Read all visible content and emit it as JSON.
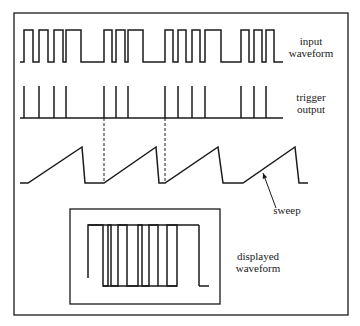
{
  "labels": {
    "input_waveform": [
      "input",
      "waveform"
    ],
    "trigger_output": [
      "trigger",
      "output"
    ],
    "sweep": "sweep",
    "displayed_waveform": [
      "displayed",
      "waveform"
    ]
  },
  "colors": {
    "ink": "#1a1a1a",
    "background": "#ffffff"
  },
  "geometry": {
    "outer_frame": {
      "x": 14,
      "y": 13,
      "w": 334,
      "h": 302
    },
    "display_box": {
      "x": 70,
      "y": 209,
      "w": 150,
      "h": 95
    },
    "input": {
      "low_y": 62,
      "high_y": 30,
      "start_x": 20,
      "end_x": 283,
      "pulses": [
        [
          24,
          33
        ],
        [
          39,
          48
        ],
        [
          54,
          63
        ],
        [
          66,
          81
        ],
        [
          104,
          112
        ],
        [
          116,
          125
        ],
        [
          128,
          143
        ],
        [
          165,
          173
        ],
        [
          178,
          186
        ],
        [
          192,
          200
        ],
        [
          205,
          221
        ],
        [
          241,
          249
        ],
        [
          254,
          262
        ],
        [
          266,
          274
        ]
      ]
    },
    "trigger": {
      "base_y": 118,
      "top_y": 86,
      "start_x": 20,
      "end_x": 283,
      "spikes": [
        24,
        39,
        54,
        66,
        104,
        116,
        128,
        165,
        178,
        192,
        205,
        241,
        254,
        266
      ]
    },
    "sweep": {
      "points": [
        [
          20,
          183
        ],
        [
          28,
          183
        ],
        [
          82,
          147
        ],
        [
          85,
          183
        ],
        [
          104,
          183
        ],
        [
          156,
          147
        ],
        [
          159,
          183
        ],
        [
          165,
          183
        ],
        [
          218,
          147
        ],
        [
          223,
          183
        ],
        [
          243,
          183
        ],
        [
          295,
          147
        ],
        [
          299,
          183
        ],
        [
          308,
          183
        ]
      ]
    },
    "dashed_links": [
      [
        104,
        118,
        183
      ],
      [
        165,
        118,
        183
      ]
    ],
    "sweep_arrow": {
      "from": [
        276,
        208
      ],
      "to": [
        263,
        173
      ]
    },
    "display": {
      "top_y": 225,
      "bottom_y": 286,
      "path": [
        [
          88,
          278
        ],
        [
          88,
          225
        ],
        [
          103,
          225
        ],
        [
          103,
          286
        ],
        [
          108,
          286
        ],
        [
          108,
          225
        ],
        [
          111,
          225
        ],
        [
          111,
          286
        ],
        [
          118,
          286
        ],
        [
          118,
          225
        ],
        [
          127,
          225
        ],
        [
          127,
          286
        ],
        [
          138,
          286
        ],
        [
          138,
          225
        ],
        [
          142,
          225
        ],
        [
          142,
          286
        ],
        [
          149,
          286
        ],
        [
          149,
          225
        ],
        [
          158,
          225
        ],
        [
          158,
          286
        ],
        [
          167,
          286
        ],
        [
          167,
          225
        ],
        [
          177,
          225
        ],
        [
          177,
          286
        ],
        [
          167,
          286
        ]
      ],
      "lines": [
        [
          88,
          225,
          199,
          225
        ],
        [
          103,
          286,
          158,
          286
        ],
        [
          167,
          286,
          177,
          286
        ],
        [
          199,
          225,
          199,
          286
        ],
        [
          199,
          286,
          209,
          286
        ]
      ]
    }
  }
}
